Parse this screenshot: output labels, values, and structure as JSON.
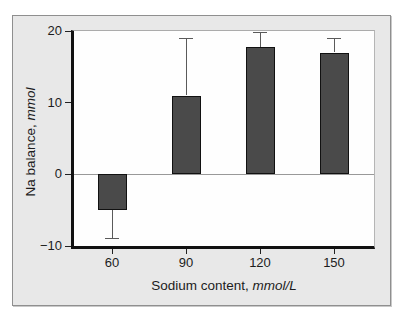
{
  "chart_data": {
    "type": "bar",
    "title": "",
    "categories": [
      "60",
      "90",
      "120",
      "150"
    ],
    "values": [
      -5,
      11,
      17.8,
      17
    ],
    "error_extents": [
      -9,
      19,
      19.8,
      19
    ],
    "xlabel": "Sodium content,",
    "xlabel_unit": "mmol/L",
    "ylabel": "Na balance,",
    "ylabel_unit": "mmol",
    "ylim": [
      -10,
      20
    ],
    "yticks": [
      20,
      10,
      0,
      -10
    ],
    "zero_line": true,
    "legend": "none",
    "grid": "off",
    "colors": {
      "bar_fill": "#4a4a4a",
      "bar_border": "#111111",
      "axis": "#111111",
      "frame_background": "#e8e8e8",
      "plot_background": "#fefefe",
      "zero_line": "#999999",
      "whisker": "#5a5a5a",
      "text": "#1c1c1c"
    }
  }
}
